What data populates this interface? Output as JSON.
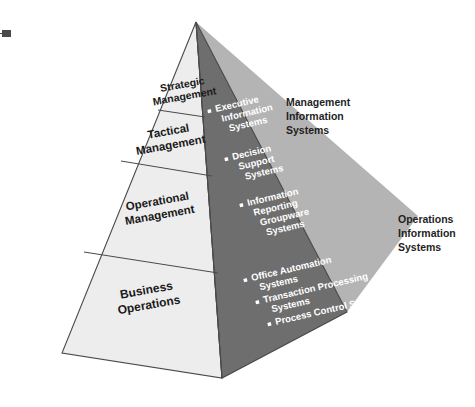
{
  "figure": {
    "colors": {
      "light_face": "#ededed",
      "dark_face": "#6e6e6e",
      "shadow": "#b4b4b4",
      "outline": "#4a4a4a",
      "label_text": "#1a1a1a",
      "bullet_text": "#ffffff",
      "callout_text": "#1f1f1f",
      "background": "#ffffff"
    },
    "levels": [
      {
        "id": "strategic",
        "label_line_1": "Strategic",
        "label_line_2": "Management"
      },
      {
        "id": "tactical",
        "label_line_1": "Tactical",
        "label_line_2": "Management"
      },
      {
        "id": "operational",
        "label_line_1": "Operational",
        "label_line_2": "Management"
      },
      {
        "id": "business",
        "label_line_1": "Business",
        "label_line_2": "Operations"
      }
    ],
    "management_systems": [
      {
        "lines": [
          "Executive",
          "Information",
          "Systems"
        ]
      },
      {
        "lines": [
          "Decision",
          "Support",
          "Systems"
        ]
      },
      {
        "lines": [
          "Information",
          "Reporting",
          "Groupware",
          "Systems"
        ]
      }
    ],
    "operations_systems": [
      {
        "lines": [
          "Office Automation",
          "Systems"
        ]
      },
      {
        "lines": [
          "Transaction Processing",
          "Systems"
        ]
      },
      {
        "lines": [
          "Process Control Systems"
        ]
      }
    ],
    "callouts": [
      {
        "id": "management-information-systems",
        "lines": [
          "Management",
          "Information",
          "Systems"
        ]
      },
      {
        "id": "operations-information-systems",
        "lines": [
          "Operations",
          "Information",
          "Systems"
        ]
      }
    ]
  }
}
